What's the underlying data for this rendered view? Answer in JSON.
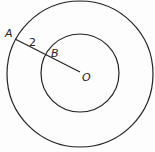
{
  "diagram": {
    "type": "concentric-circles",
    "center": {
      "label": "O",
      "x": 80,
      "y": 72
    },
    "outer_circle": {
      "r": 73
    },
    "inner_circle": {
      "r": 39
    },
    "points": [
      {
        "label": "A",
        "x": 15,
        "y": 39
      },
      {
        "label": "B",
        "x": 45,
        "y": 52
      },
      {
        "label": "O",
        "x": 80,
        "y": 72
      }
    ],
    "segment_label": "2",
    "stroke_color": "#222222"
  }
}
